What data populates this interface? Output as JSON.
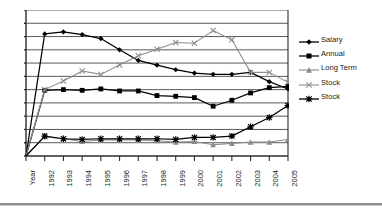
{
  "chart_data": {
    "type": "line",
    "title": "",
    "subtitle": "",
    "xlabel": "",
    "ylabel": "",
    "grid": "horizontal",
    "legend_position": "right",
    "x_tick_labels": [
      "Year",
      "1992",
      "1993",
      "1994",
      "1995",
      "1996",
      "1997",
      "1998",
      "1999",
      "2000",
      "2001",
      "2002",
      "2003",
      "2004",
      "2005"
    ],
    "categories": [
      "Year",
      "1992",
      "1993",
      "1994",
      "1995",
      "1996",
      "1997",
      "1998",
      "1999",
      "2000",
      "2001",
      "2002",
      "2003",
      "2004",
      "2005"
    ],
    "ylim": [
      0,
      11
    ],
    "y_tick_count": 11,
    "y_tick_labels_shown": false,
    "series": [
      {
        "name": "Salary",
        "marker": "diamond",
        "color": "#000000",
        "values": [
          0,
          9.2,
          9.35,
          9.15,
          8.85,
          8.0,
          7.2,
          6.85,
          6.5,
          6.25,
          6.15,
          6.15,
          6.3,
          5.6,
          5.05
        ]
      },
      {
        "name": "Annual",
        "marker": "square",
        "color": "#000000",
        "values": [
          0,
          4.95,
          5.0,
          4.95,
          5.05,
          4.9,
          4.9,
          4.55,
          4.5,
          4.4,
          3.75,
          4.2,
          4.75,
          5.15,
          5.25
        ]
      },
      {
        "name": "Long Term",
        "marker": "triangle",
        "color": "#8c8c8c",
        "values": [
          0,
          1.45,
          1.3,
          1.1,
          1.2,
          1.2,
          1.2,
          1.15,
          1.05,
          1.1,
          0.85,
          0.95,
          1.05,
          1.05,
          1.25
        ]
      },
      {
        "name": "Stock",
        "marker": "x",
        "color": "#8c8c8c",
        "values": [
          0,
          5.0,
          5.65,
          6.4,
          6.15,
          6.85,
          7.55,
          8.05,
          8.55,
          8.5,
          9.45,
          8.75,
          6.3,
          6.3,
          5.55
        ]
      },
      {
        "name": "Stock",
        "marker": "asterisk",
        "color": "#000000",
        "values": [
          0,
          1.5,
          1.3,
          1.25,
          1.3,
          1.3,
          1.3,
          1.3,
          1.25,
          1.4,
          1.4,
          1.5,
          2.2,
          2.9,
          3.8
        ]
      }
    ]
  },
  "legend": {
    "entries": [
      {
        "label": "Salary"
      },
      {
        "label": "Annual"
      },
      {
        "label": "Long Term"
      },
      {
        "label": "Stock"
      },
      {
        "label": "Stock"
      }
    ]
  }
}
